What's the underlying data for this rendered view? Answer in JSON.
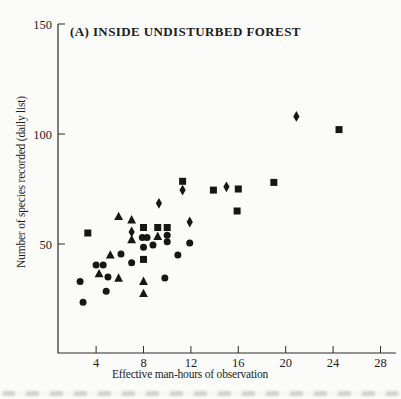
{
  "figure": {
    "title": "(A) INSIDE UNDISTURBED FOREST",
    "xlabel": "Effective man-hours of observation",
    "ylabel": "Number of species recorded (daily list)",
    "marker_color": "#161616",
    "axis_color": "#2b2b2b"
  },
  "chart_data": {
    "type": "scatter",
    "title": "(A) INSIDE UNDISTURBED FOREST",
    "xlabel": "Effective man-hours of observation",
    "ylabel": "Number of species recorded (daily list)",
    "xlim": [
      0,
      29.3
    ],
    "ylim": [
      0,
      150
    ],
    "x_ticks": [
      4,
      8,
      12,
      16,
      20,
      24,
      28
    ],
    "y_ticks": [
      50,
      100,
      150
    ],
    "grid": false,
    "legend": "none",
    "marker_color": "#161616",
    "series": [
      {
        "name": "circle-markers",
        "marker": "circle",
        "points": [
          [
            2.9,
            23.5
          ],
          [
            2.65,
            33
          ],
          [
            4.0,
            40.5
          ],
          [
            4.6,
            40.5
          ],
          [
            4.85,
            28.5
          ],
          [
            5.0,
            35
          ],
          [
            6.1,
            45.5
          ],
          [
            7.0,
            41.5
          ],
          [
            7.9,
            53
          ],
          [
            8.3,
            53
          ],
          [
            8.0,
            48.5
          ],
          [
            8.8,
            49.5
          ],
          [
            9.8,
            34.5
          ],
          [
            10.0,
            54
          ],
          [
            10.0,
            51
          ],
          [
            10.9,
            45
          ],
          [
            11.9,
            50.5
          ]
        ]
      },
      {
        "name": "triangle-markers",
        "marker": "triangle-up",
        "points": [
          [
            4.25,
            36.5
          ],
          [
            5.2,
            45
          ],
          [
            5.9,
            34.5
          ],
          [
            5.9,
            62.5
          ],
          [
            7.0,
            61
          ],
          [
            7.0,
            52
          ],
          [
            8.0,
            33
          ],
          [
            8.0,
            27.5
          ],
          [
            9.2,
            53.5
          ]
        ]
      },
      {
        "name": "square-markers",
        "marker": "square",
        "points": [
          [
            3.3,
            55
          ],
          [
            8.0,
            57.5
          ],
          [
            8.0,
            43
          ],
          [
            9.2,
            57.5
          ],
          [
            10.0,
            57.5
          ],
          [
            11.3,
            78.5
          ],
          [
            13.9,
            74.5
          ],
          [
            16.0,
            75
          ],
          [
            15.9,
            65
          ],
          [
            19.0,
            78
          ],
          [
            24.5,
            102
          ]
        ]
      },
      {
        "name": "diamond-markers",
        "marker": "diamond",
        "points": [
          [
            7.0,
            55.5
          ],
          [
            9.3,
            68.5
          ],
          [
            11.3,
            74.5
          ],
          [
            11.9,
            60
          ],
          [
            15.0,
            76
          ],
          [
            20.9,
            108
          ]
        ]
      }
    ]
  }
}
